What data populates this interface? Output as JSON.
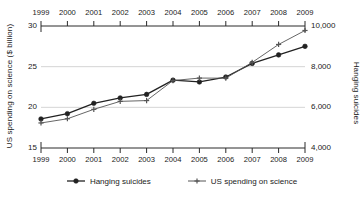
{
  "chart_data": {
    "type": "line",
    "title": "",
    "subtitle": "",
    "x": [
      1999,
      2000,
      2001,
      2002,
      2003,
      2004,
      2005,
      2006,
      2007,
      2008,
      2009
    ],
    "xlabel": "",
    "xtick_labels": [
      "1999",
      "2000",
      "2001",
      "2002",
      "2003",
      "2004",
      "2005",
      "2006",
      "2007",
      "2008",
      "2009"
    ],
    "xlim": [
      1999,
      2009
    ],
    "grid": true,
    "grid_axis": "y",
    "legend_position": "bottom",
    "dual_axis": true,
    "axes": {
      "left": {
        "label": "US spending on science ($ billion)",
        "ticks": [
          15,
          20,
          25,
          30
        ],
        "tick_labels": [
          "15",
          "20",
          "25",
          "30"
        ],
        "lim": [
          15,
          30
        ]
      },
      "right": {
        "label": "Hanging suicides",
        "ticks": [
          4000,
          6000,
          8000,
          10000
        ],
        "tick_labels": [
          "4,000",
          "6,000",
          "8,000",
          "10,000"
        ],
        "lim": [
          4000,
          10000
        ]
      }
    },
    "series": [
      {
        "name": "Hanging suicides",
        "axis": "right",
        "marker": "filled-circle",
        "color": "#222222",
        "values": [
          5427,
          5688,
          6198,
          6462,
          6635,
          7336,
          7248,
          7491,
          8161,
          8578,
          9000
        ]
      },
      {
        "name": "US spending on science",
        "axis": "left",
        "marker": "plus",
        "color": "#555555",
        "values": [
          18.079,
          18.594,
          19.753,
          20.734,
          20.831,
          23.29,
          23.597,
          23.584,
          25.525,
          27.731,
          29.449
        ]
      }
    ]
  },
  "legend": {
    "items": [
      {
        "label": "Hanging suicides",
        "marker": "filled-circle"
      },
      {
        "label": "US spending on science",
        "marker": "plus"
      }
    ]
  }
}
